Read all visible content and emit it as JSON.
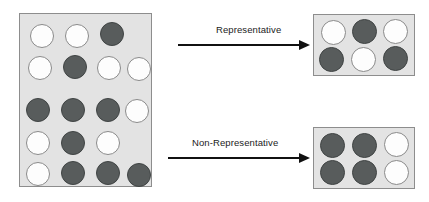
{
  "diagram": {
    "colors": {
      "box_fill": "#e3e3e3",
      "box_border": "#8d8d8d",
      "light_circle": "#fdfdfd",
      "dark_circle": "#585c5c",
      "arrow": "#111111",
      "label_text": "#1b1b1b",
      "page_background": "#ffffff"
    }
  },
  "population": {
    "name": "population-box",
    "total_circles": 18,
    "light_count": 9,
    "dark_count": 9,
    "rows": [
      {
        "row_index": 1,
        "circles": [
          {
            "fill": "light",
            "x": 10,
            "y": 10
          },
          {
            "fill": "light",
            "x": 45,
            "y": 10
          },
          {
            "fill": "dark",
            "x": 80,
            "y": 8
          }
        ]
      },
      {
        "row_index": 2,
        "circles": [
          {
            "fill": "light",
            "x": 8,
            "y": 42
          },
          {
            "fill": "dark",
            "x": 43,
            "y": 41
          },
          {
            "fill": "light",
            "x": 77,
            "y": 42
          },
          {
            "fill": "light",
            "x": 107,
            "y": 43
          }
        ]
      },
      {
        "row_index": 3,
        "circles": [
          {
            "fill": "dark",
            "x": 6,
            "y": 84
          },
          {
            "fill": "dark",
            "x": 41,
            "y": 84
          },
          {
            "fill": "dark",
            "x": 76,
            "y": 84
          },
          {
            "fill": "light",
            "x": 105,
            "y": 85
          }
        ]
      },
      {
        "row_index": 4,
        "circles": [
          {
            "fill": "light",
            "x": 6,
            "y": 117
          },
          {
            "fill": "dark",
            "x": 41,
            "y": 117
          },
          {
            "fill": "light",
            "x": 76,
            "y": 117
          }
        ]
      },
      {
        "row_index": 5,
        "circles": [
          {
            "fill": "light",
            "x": 6,
            "y": 148
          },
          {
            "fill": "dark",
            "x": 41,
            "y": 147
          },
          {
            "fill": "dark",
            "x": 76,
            "y": 147
          },
          {
            "fill": "dark",
            "x": 107,
            "y": 149
          }
        ]
      }
    ]
  },
  "flows": [
    {
      "id": "representative",
      "label": "Representative",
      "arrow_direction": "right"
    },
    {
      "id": "non-representative",
      "label": "Non-Representative",
      "arrow_direction": "right"
    }
  ],
  "sample_representative": {
    "name": "representative-sample-box",
    "total_circles": 6,
    "light_count": 3,
    "dark_count": 3,
    "rows": [
      {
        "row_index": 1,
        "circles": [
          {
            "fill": "light",
            "x": 7,
            "y": 5
          },
          {
            "fill": "dark",
            "x": 38,
            "y": 4
          },
          {
            "fill": "light",
            "x": 69,
            "y": 4
          }
        ]
      },
      {
        "row_index": 2,
        "circles": [
          {
            "fill": "dark",
            "x": 5,
            "y": 32
          },
          {
            "fill": "light",
            "x": 37,
            "y": 32
          },
          {
            "fill": "dark",
            "x": 69,
            "y": 31
          }
        ]
      }
    ]
  },
  "sample_non_representative": {
    "name": "non-representative-sample-box",
    "total_circles": 6,
    "light_count": 2,
    "dark_count": 4,
    "rows": [
      {
        "row_index": 1,
        "circles": [
          {
            "fill": "dark",
            "x": 6,
            "y": 5
          },
          {
            "fill": "dark",
            "x": 38,
            "y": 5
          },
          {
            "fill": "light",
            "x": 70,
            "y": 4
          }
        ]
      },
      {
        "row_index": 2,
        "circles": [
          {
            "fill": "dark",
            "x": 6,
            "y": 32
          },
          {
            "fill": "dark",
            "x": 38,
            "y": 32
          },
          {
            "fill": "light",
            "x": 70,
            "y": 32
          }
        ]
      }
    ]
  }
}
